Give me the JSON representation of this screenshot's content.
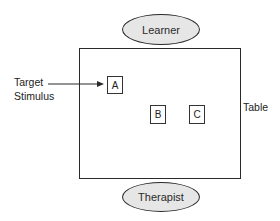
{
  "diagram": {
    "nodes": {
      "learner": {
        "label": "Learner"
      },
      "therapist": {
        "label": "Therapist"
      },
      "table": {
        "label": "Table"
      },
      "stimulus_a": {
        "label": "A"
      },
      "stimulus_b": {
        "label": "B"
      },
      "stimulus_c": {
        "label": "C"
      }
    },
    "annotations": {
      "target_line1": "Target",
      "target_line2": "Stimulus"
    },
    "edges": [
      {
        "from": "Target Stimulus label",
        "to": "A",
        "type": "arrow"
      }
    ],
    "colors": {
      "ellipse_fill": "#e6e6e6",
      "stroke": "#2a2a2a"
    }
  }
}
